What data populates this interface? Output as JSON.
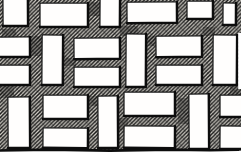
{
  "illustration": {
    "type": "ink-drawing",
    "subject": "basketweave-brick-paving-pattern",
    "canvas": {
      "width": 241,
      "height": 157,
      "drawing_bottom": 150
    },
    "palette": {
      "paper": "#ffffff",
      "ink": "#181818",
      "ink_heavy": "#0d0d0d",
      "mortar_base": "#d6d3cb",
      "brick_fill": "#fffefd"
    },
    "hatch": {
      "spacing": 3.8,
      "line_width": 1.5,
      "cross_spacing": 9,
      "cross_line_width": 1.1,
      "cross_opacity": 0.25
    },
    "stroke": {
      "brick_width": 1.25,
      "shadow_width": 2.5,
      "bottom_edge_width": 2.6
    },
    "bricks": [
      {
        "id": "a1",
        "row": 1,
        "orientation": "vertical",
        "x": 3,
        "y": -3,
        "w": 25,
        "h": 29
      },
      {
        "id": "a2",
        "row": 1,
        "orientation": "horizontal",
        "x": 40,
        "y": 3,
        "w": 48,
        "h": 24
      },
      {
        "id": "a3",
        "row": 1,
        "orientation": "vertical",
        "x": 100,
        "y": -3,
        "w": 20,
        "h": 30
      },
      {
        "id": "a4",
        "row": 1,
        "orientation": "horizontal",
        "x": 127,
        "y": 2,
        "w": 50,
        "h": 21
      },
      {
        "id": "a5",
        "row": 1,
        "orientation": "vertical",
        "x": 187,
        "y": 1,
        "w": 26,
        "h": 18
      },
      {
        "id": "a6",
        "row": 1,
        "orientation": "horizontal",
        "x": 223,
        "y": 3,
        "w": 13,
        "h": 22
      },
      {
        "id": "b1",
        "row": 2,
        "orientation": "horizontal",
        "x": -4,
        "y": 37,
        "w": 34,
        "h": 20
      },
      {
        "id": "b2",
        "row": 2,
        "orientation": "horizontal",
        "x": -4,
        "y": 65,
        "w": 34,
        "h": 20
      },
      {
        "id": "b3",
        "row": 2,
        "orientation": "vertical",
        "x": 42,
        "y": 35,
        "w": 21,
        "h": 50
      },
      {
        "id": "b4",
        "row": 2,
        "orientation": "horizontal",
        "x": 74,
        "y": 38,
        "w": 46,
        "h": 21
      },
      {
        "id": "b5",
        "row": 2,
        "orientation": "horizontal",
        "x": 74,
        "y": 67,
        "w": 46,
        "h": 20
      },
      {
        "id": "b6",
        "row": 2,
        "orientation": "vertical",
        "x": 126,
        "y": 34,
        "w": 20,
        "h": 53
      },
      {
        "id": "b7",
        "row": 2,
        "orientation": "horizontal",
        "x": 156,
        "y": 36,
        "w": 46,
        "h": 21
      },
      {
        "id": "b8",
        "row": 2,
        "orientation": "horizontal",
        "x": 156,
        "y": 65,
        "w": 46,
        "h": 20
      },
      {
        "id": "b9",
        "row": 2,
        "orientation": "vertical",
        "x": 213,
        "y": 35,
        "w": 24,
        "h": 50
      },
      {
        "id": "c1",
        "row": 3,
        "orientation": "vertical",
        "x": 8,
        "y": 97,
        "w": 22,
        "h": 51
      },
      {
        "id": "c2",
        "row": 3,
        "orientation": "horizontal",
        "x": 43,
        "y": 95,
        "w": 45,
        "h": 24
      },
      {
        "id": "c3",
        "row": 3,
        "orientation": "horizontal",
        "x": 43,
        "y": 128,
        "w": 45,
        "h": 20
      },
      {
        "id": "c4",
        "row": 3,
        "orientation": "vertical",
        "x": 98,
        "y": 96,
        "w": 20,
        "h": 52
      },
      {
        "id": "c5",
        "row": 3,
        "orientation": "horizontal",
        "x": 124,
        "y": 92,
        "w": 51,
        "h": 24
      },
      {
        "id": "c6",
        "row": 3,
        "orientation": "horizontal",
        "x": 124,
        "y": 126,
        "w": 51,
        "h": 22
      },
      {
        "id": "c7",
        "row": 3,
        "orientation": "vertical",
        "x": 189,
        "y": 94,
        "w": 20,
        "h": 55
      },
      {
        "id": "c8",
        "row": 3,
        "orientation": "horizontal",
        "x": 220,
        "y": 95,
        "w": 24,
        "h": 22
      },
      {
        "id": "c9",
        "row": 3,
        "orientation": "horizontal",
        "x": 220,
        "y": 126,
        "w": 24,
        "h": 23
      }
    ],
    "paper_patches": [
      {
        "x": 238.2,
        "y": 33,
        "w": 3.3,
        "h": 56
      },
      {
        "x": 0,
        "y": 151.8,
        "w": 241,
        "h": 5.2
      }
    ],
    "smudges": [
      {
        "x": 2,
        "y": 29,
        "w": 14,
        "h": 8
      },
      {
        "x": 30,
        "y": 36,
        "w": 13,
        "h": 20
      },
      {
        "x": 88,
        "y": 2,
        "w": 12,
        "h": 14
      },
      {
        "x": 120,
        "y": 26,
        "w": 18,
        "h": 10
      },
      {
        "x": 203,
        "y": 27,
        "w": 12,
        "h": 9
      },
      {
        "x": 0,
        "y": 86,
        "w": 14,
        "h": 12
      },
      {
        "x": 64,
        "y": 58,
        "w": 12,
        "h": 8
      },
      {
        "x": 146,
        "y": 36,
        "w": 10,
        "h": 10
      },
      {
        "x": 178,
        "y": 98,
        "w": 12,
        "h": 26
      },
      {
        "x": 118,
        "y": 118,
        "w": 10,
        "h": 12
      },
      {
        "x": 88,
        "y": 96,
        "w": 12,
        "h": 10
      },
      {
        "x": 230,
        "y": 86,
        "w": 11,
        "h": 9
      }
    ],
    "bottom_edge": {
      "points": [
        [
          0,
          150.5
        ],
        [
          50,
          149.6
        ],
        [
          110,
          150.6
        ],
        [
          170,
          149.6
        ],
        [
          210,
          150.2
        ],
        [
          238.5,
          149.8
        ]
      ]
    }
  }
}
